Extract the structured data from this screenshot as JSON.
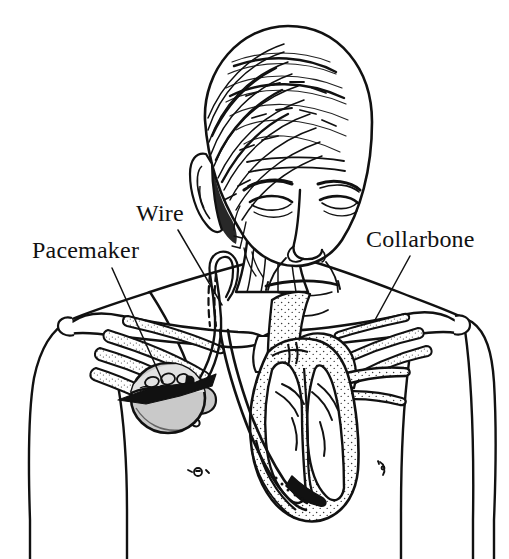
{
  "figure": {
    "background_color": "#ffffff",
    "ink_color": "#111111",
    "device_fill_color": "#c9c9c9",
    "stipple_color": "#333333",
    "width": 509,
    "height": 559
  },
  "labels": [
    {
      "id": "pacemaker",
      "text": "Pacemaker",
      "x": 32,
      "y": 237,
      "font_size": 24,
      "leader_from": [
        112,
        268
      ],
      "leader_to": [
        163,
        382
      ]
    },
    {
      "id": "wire",
      "text": "Wire",
      "x": 136,
      "y": 200,
      "font_size": 24,
      "leader_from": [
        178,
        230
      ],
      "leader_to": [
        222,
        305
      ]
    },
    {
      "id": "collarbone",
      "text": "Collarbone",
      "x": 366,
      "y": 226,
      "font_size": 24,
      "leader_from": [
        410,
        256
      ],
      "leader_to": [
        375,
        320
      ]
    }
  ],
  "anatomy": {
    "head": "bald-man-head-with-hatched-hair",
    "face_features": [
      "eyebrows",
      "eyes",
      "nose",
      "mouth",
      "ear",
      "cheek-lines",
      "chin"
    ],
    "neck": "sternocleidomastoid-muscle",
    "clavicle_left": "left-collarbone",
    "clavicle_right": "right-collarbone",
    "ribs": "upper-ribs-visible-through-skin",
    "heart": "cross-section-right-and-left-chambers",
    "vessels": [
      "superior-vena-cava",
      "subclavian-vein",
      "aortic-arch",
      "pulmonary-artery"
    ],
    "nipples": 2
  },
  "device": {
    "name": "pacemaker-generator",
    "shape": "rounded-disc",
    "fill": "#c9c9c9",
    "center": [
      168,
      398
    ],
    "radius": 36,
    "internal_marks": "circuit-circles",
    "cutaway_band": "dark-pointed-horizontal-band",
    "lead_name": "pacing-wire-lead",
    "lead_path": "from device up under clavicle, through subclavian vein and superior vena cava, down into right ventricle apex"
  }
}
